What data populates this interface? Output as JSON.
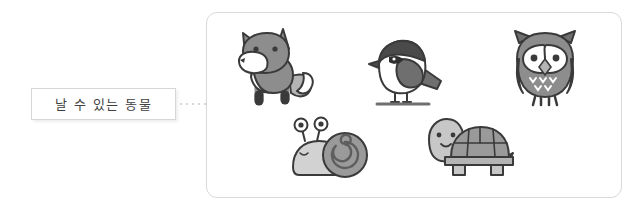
{
  "canvas": {
    "width": 644,
    "height": 210,
    "background": "#ffffff"
  },
  "category": {
    "label": "날 수 있는 동물",
    "label_romanized_meaning": "animals that can fly",
    "box_border_color": "#d6d6d6",
    "text_color": "#3f3f3f"
  },
  "connector": {
    "style": "dotted",
    "dot_count": 5,
    "color": "#c9c9c9"
  },
  "panel": {
    "border_color": "#d9d9d9",
    "corner_radius": "11px",
    "items": [
      {
        "name": "fox",
        "icon": "fox-illustration",
        "row": 1,
        "col": 1
      },
      {
        "name": "bird",
        "icon": "bird-illustration",
        "row": 1,
        "col": 2
      },
      {
        "name": "owl",
        "icon": "owl-illustration",
        "row": 1,
        "col": 3
      },
      {
        "name": "snail",
        "icon": "snail-illustration",
        "row": 2,
        "col": 1
      },
      {
        "name": "turtle",
        "icon": "turtle-illustration",
        "row": 2,
        "col": 2
      }
    ]
  },
  "palette": {
    "outline": "#3a3a3a",
    "gray_dark": "#6f6f6f",
    "gray_mid": "#8d8d8d",
    "gray_light": "#b4b4b4",
    "gray_pale": "#d2d2d2",
    "white": "#ffffff"
  }
}
